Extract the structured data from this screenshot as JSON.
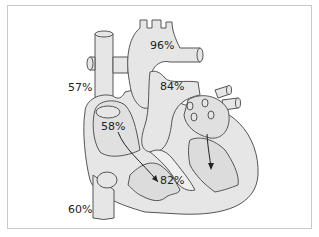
{
  "diagram": {
    "colors": {
      "fill": "#e6e6e6",
      "inner_fill": "#d9d9d9",
      "stroke": "#555555",
      "frame": "#c8c8c8",
      "text": "#222222"
    },
    "labels": [
      {
        "id": "aorta",
        "text": "96%"
      },
      {
        "id": "pulmonary-artery",
        "text": "84%"
      },
      {
        "id": "superior-vena-cava",
        "text": "57%"
      },
      {
        "id": "right-atrium",
        "text": "58%"
      },
      {
        "id": "right-ventricle",
        "text": "82%"
      },
      {
        "id": "inferior-vena-cava",
        "text": "60%"
      }
    ]
  }
}
